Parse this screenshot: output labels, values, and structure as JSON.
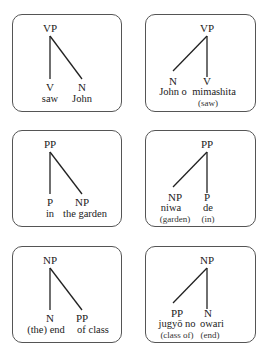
{
  "diagrams": [
    {
      "root": "VP",
      "left": {
        "cat": "V",
        "word": "saw",
        "gloss": ""
      },
      "right": {
        "cat": "N",
        "word": "John",
        "gloss": ""
      }
    },
    {
      "root": "VP",
      "left": {
        "cat": "N",
        "word": "John o",
        "gloss": ""
      },
      "right": {
        "cat": "V",
        "word": "mimashita",
        "gloss": "(saw)"
      }
    },
    {
      "root": "PP",
      "left": {
        "cat": "P",
        "word": "in",
        "gloss": ""
      },
      "right": {
        "cat": "NP",
        "word": "the garden",
        "gloss": ""
      }
    },
    {
      "root": "PP",
      "left": {
        "cat": "NP",
        "word": "niwa",
        "gloss": "(garden)"
      },
      "right": {
        "cat": "P",
        "word": "de",
        "gloss": "(in)"
      }
    },
    {
      "root": "NP",
      "left": {
        "cat": "N",
        "word": "(the) end",
        "gloss": ""
      },
      "right": {
        "cat": "PP",
        "word": "of class",
        "gloss": ""
      }
    },
    {
      "root": "NP",
      "left": {
        "cat": "PP",
        "word": "jugyō no",
        "gloss": "(class of)"
      },
      "right": {
        "cat": "N",
        "word": "owari",
        "gloss": "(end)"
      }
    }
  ]
}
